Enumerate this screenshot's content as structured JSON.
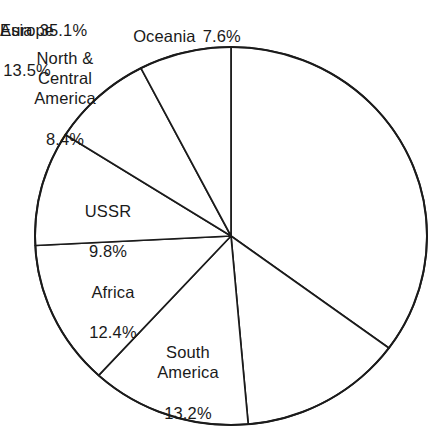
{
  "chart_data": {
    "type": "pie",
    "title": "",
    "subtitle": "",
    "categories": [
      "Asia",
      "Europe",
      "South America",
      "Africa",
      "USSR",
      "North & Central America",
      "Oceania"
    ],
    "values": [
      35.1,
      13.5,
      13.2,
      12.4,
      9.8,
      8.4,
      7.6
    ],
    "unit": "%",
    "start_angle_deg": 0,
    "direction": "clockwise",
    "legend": "none",
    "grid": false,
    "slice_fill": "#ffffff",
    "slice_stroke": "#1b1b1b",
    "slices": [
      {
        "name": "Asia",
        "value": 35.1,
        "label_name": "Asia",
        "label_value": "35.1%",
        "label_placement": "inside",
        "label_layout": "inline"
      },
      {
        "name": "Europe",
        "value": 13.5,
        "label_name": "Europe",
        "label_value": "13.5%",
        "label_placement": "inside",
        "label_layout": "stacked"
      },
      {
        "name": "South America",
        "value": 13.2,
        "label_name": "South\nAmerica",
        "label_value": "13.2%",
        "label_placement": "inside",
        "label_layout": "stacked"
      },
      {
        "name": "Africa",
        "value": 12.4,
        "label_name": "Africa",
        "label_value": "12.4%",
        "label_placement": "inside",
        "label_layout": "stacked"
      },
      {
        "name": "USSR",
        "value": 9.8,
        "label_name": "USSR",
        "label_value": "9.8%",
        "label_placement": "inside",
        "label_layout": "stacked"
      },
      {
        "name": "North & Central America",
        "value": 8.4,
        "label_name": "North &\nCentral\nAmerica",
        "label_value": "8.4%",
        "label_placement": "outside",
        "label_layout": "stacked"
      },
      {
        "name": "Oceania",
        "value": 7.6,
        "label_name": "Oceania",
        "label_value": "7.6%",
        "label_placement": "outside",
        "label_layout": "inline"
      }
    ]
  },
  "geometry": {
    "center_x": 231,
    "center_y": 236,
    "radius_x": 196,
    "radius_y": 189
  }
}
